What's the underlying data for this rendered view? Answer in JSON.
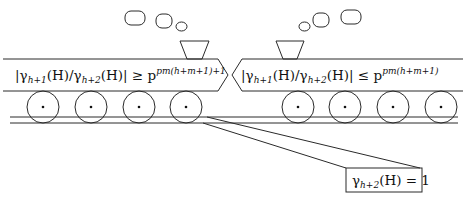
{
  "diagram": {
    "type": "two-trains-metaphor",
    "left_train": {
      "label_parts": {
        "lhs": "|γ",
        "sub1": "h+1",
        "mid1": "(H)/γ",
        "sub2": "h+2",
        "mid2": "(H)| ≥ p",
        "sup": "pm(h+m+1)+1"
      },
      "label_full": "|γ_{h+1}(H)/γ_{h+2}(H)| ≥ p^{pm(h+m+1)+1}",
      "direction": "right",
      "wheel_count": 4,
      "smoke_puffs": 3
    },
    "right_train": {
      "label_parts": {
        "lhs": "|γ",
        "sub1": "h+1",
        "mid1": "(H)/γ",
        "sub2": "h+2",
        "mid2": "(H)| ≤ p",
        "sup": "pm(h+m+1)"
      },
      "label_full": "|γ_{h+1}(H)/γ_{h+2}(H)| ≤ p^{pm(h+m+1)}",
      "direction": "left",
      "wheel_count": 4,
      "smoke_puffs": 3
    },
    "callout": {
      "label_parts": {
        "lhs": "γ",
        "sub": "h+2",
        "rhs": "(H) = 1"
      },
      "label_full": "γ_{h+2}(H) = 1"
    },
    "colors": {
      "line": "#2a2a2a",
      "background": "#ffffff"
    }
  }
}
